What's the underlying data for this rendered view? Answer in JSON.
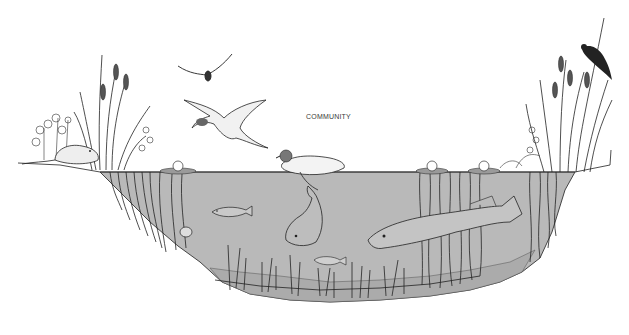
{
  "diagram": {
    "title_label": "COMMUNITY",
    "style": "black-and-white line illustration",
    "colors": {
      "background": "#ffffff",
      "water": "#b9b9b9",
      "pond_bed": "#a9a9a9",
      "ink": "#222222"
    },
    "elements": [
      {
        "name": "muskrat",
        "location": "left shore"
      },
      {
        "name": "cattails-left",
        "location": "left shore"
      },
      {
        "name": "shrubs-left",
        "location": "left shore"
      },
      {
        "name": "flying-duck-small",
        "location": "sky upper-left"
      },
      {
        "name": "flying-mallard",
        "location": "sky left-center"
      },
      {
        "name": "swimming-mallard",
        "location": "water surface center"
      },
      {
        "name": "water-lilies",
        "location": "water surface"
      },
      {
        "name": "red-winged-blackbird",
        "location": "right cattails"
      },
      {
        "name": "cattails-right",
        "location": "right shore"
      },
      {
        "name": "small-perch",
        "location": "upper-left water"
      },
      {
        "name": "bass",
        "location": "center water, head down"
      },
      {
        "name": "pike",
        "location": "right-center water"
      },
      {
        "name": "small-minnow",
        "location": "lower center water"
      },
      {
        "name": "snail",
        "location": "left pond slope"
      },
      {
        "name": "submerged-weeds",
        "location": "pond bottom"
      },
      {
        "name": "emergent-stems",
        "location": "left and right margins"
      }
    ]
  }
}
